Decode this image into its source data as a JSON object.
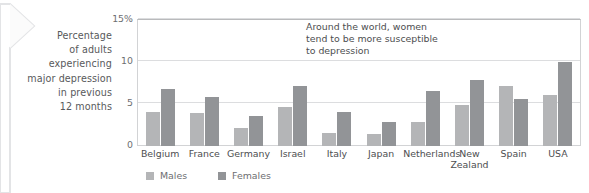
{
  "caption": {
    "lines": [
      "Percentage",
      "of adults",
      "experiencing",
      "major depression",
      "in previous",
      "12 months"
    ]
  },
  "annotation": {
    "lines": [
      "Around the world, women",
      "tend to be more susceptible",
      "to depression"
    ]
  },
  "legend": {
    "items": [
      {
        "label": "Males",
        "color": "#b4b5b7"
      },
      {
        "label": "Females",
        "color": "#929497"
      }
    ]
  },
  "colors": {
    "males": "#b4b5b7",
    "females": "#929497",
    "gridline": "#dcdddf",
    "frame": "#d2d3d5",
    "text": "#4d4e50",
    "axis_text": "#6d6e71"
  },
  "chart_data": {
    "type": "bar",
    "title": "",
    "xlabel": "",
    "ylabel": "Percentage of adults experiencing major depression in previous 12 months",
    "ylim": [
      0,
      15
    ],
    "yticks": [
      0,
      5,
      10,
      15
    ],
    "ytick_labels": [
      "0",
      "5",
      "10",
      "15%"
    ],
    "grid": true,
    "legend_position": "bottom-left",
    "annotations": [
      "Around the world, women tend to be more susceptible to depression"
    ],
    "categories": [
      "Belgium",
      "France",
      "Germany",
      "Israel",
      "Italy",
      "Japan",
      "Netherlands",
      "New Zealand",
      "Spain",
      "USA"
    ],
    "category_label_lines": [
      [
        "Belgium"
      ],
      [
        "France"
      ],
      [
        "Germany"
      ],
      [
        "Israel"
      ],
      [
        "Italy"
      ],
      [
        "Japan"
      ],
      [
        "Netherlands"
      ],
      [
        "New",
        "Zealand"
      ],
      [
        "Spain"
      ],
      [
        "USA"
      ]
    ],
    "series": [
      {
        "name": "Males",
        "color": "#b4b5b7",
        "values": [
          4.0,
          3.9,
          2.2,
          4.6,
          1.5,
          1.4,
          2.9,
          4.9,
          7.1,
          6.1
        ]
      },
      {
        "name": "Females",
        "color": "#929497",
        "values": [
          6.8,
          5.8,
          3.6,
          7.1,
          4.0,
          2.9,
          6.5,
          7.9,
          5.6,
          10.0
        ]
      }
    ]
  }
}
